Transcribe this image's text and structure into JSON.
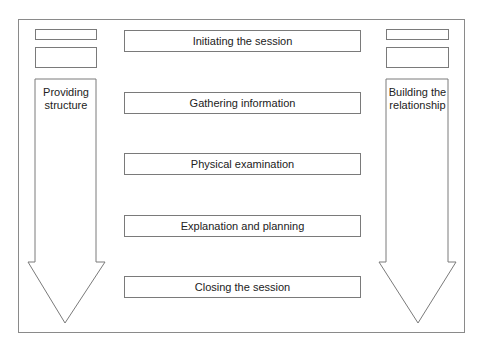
{
  "diagram": {
    "stages": [
      {
        "label": "Initiating the session"
      },
      {
        "label": "Gathering information"
      },
      {
        "label": "Physical examination"
      },
      {
        "label": "Explanation and planning"
      },
      {
        "label": "Closing the session"
      }
    ],
    "left_arrow": {
      "label_line1": "Providing",
      "label_line2": "structure"
    },
    "right_arrow": {
      "label_line1": "Building the",
      "label_line2": "relationship"
    },
    "colors": {
      "stroke": "#7a7a7a",
      "text": "#222222",
      "background": "#ffffff"
    }
  }
}
